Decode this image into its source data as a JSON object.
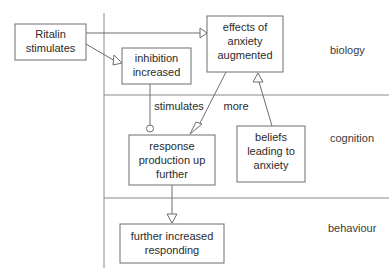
{
  "diagram": {
    "colors": {
      "line": "#6e6e6e",
      "divider": "#8a8a8a",
      "text": "#2b2b2b",
      "background": "#ffffff"
    },
    "boxes": [
      {
        "id": "ritalin",
        "lines": [
          "Ritalin",
          "stimulates"
        ]
      },
      {
        "id": "inhibition",
        "lines": [
          "inhibition",
          "increased"
        ]
      },
      {
        "id": "effects",
        "lines": [
          "effects of",
          "anxiety",
          "augmented"
        ]
      },
      {
        "id": "response",
        "lines": [
          "response",
          "production up",
          "further"
        ]
      },
      {
        "id": "beliefs",
        "lines": [
          "beliefs",
          "leading to",
          "anxiety"
        ]
      },
      {
        "id": "further",
        "lines": [
          "further increased",
          "responding"
        ]
      }
    ],
    "edge_labels": [
      {
        "id": "stimulates",
        "text": "stimulates"
      },
      {
        "id": "more",
        "text": "more"
      }
    ],
    "level_labels": [
      {
        "id": "biology",
        "text": "biology"
      },
      {
        "id": "cognition",
        "text": "cognition"
      },
      {
        "id": "behaviour",
        "text": "behaviour"
      }
    ]
  }
}
